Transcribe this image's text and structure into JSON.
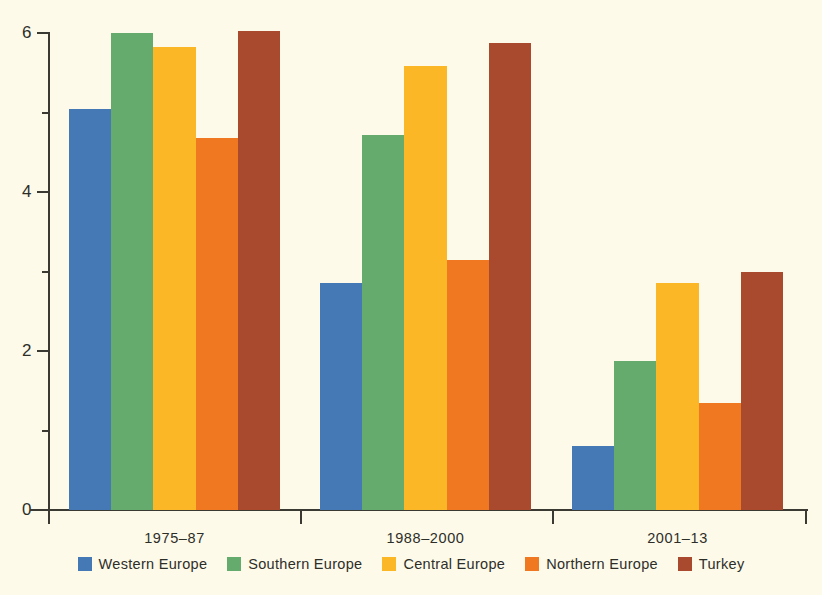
{
  "chart_data": {
    "type": "bar",
    "title": "",
    "subtitle": "",
    "xlabel": "",
    "ylabel": "",
    "categories": [
      "1975–87",
      "1988–2000",
      "2001–13"
    ],
    "series": [
      {
        "name": "Western Europe",
        "color": "#4479b5",
        "values": [
          5.05,
          2.85,
          0.8
        ]
      },
      {
        "name": "Southern Europe",
        "color": "#66ab6e",
        "values": [
          6.0,
          4.72,
          1.87
        ]
      },
      {
        "name": "Central Europe",
        "color": "#fcb726",
        "values": [
          5.82,
          5.58,
          2.85
        ]
      },
      {
        "name": "Northern Europe",
        "color": "#f07820",
        "values": [
          4.68,
          3.15,
          1.35
        ]
      },
      {
        "name": "Turkey",
        "color": "#a94a2e",
        "values": [
          6.02,
          5.88,
          3.0
        ]
      }
    ],
    "ylim": [
      0,
      6
    ],
    "y_ticks": [
      0,
      2,
      4,
      6
    ],
    "y_tick_labels": [
      "0",
      "2",
      "4",
      "6"
    ],
    "y_minor_ticks": [
      1,
      3,
      5
    ],
    "grid": false,
    "legend_position": "bottom"
  },
  "axes": {
    "y_label_0": "0",
    "y_label_2": "2",
    "y_label_4": "4",
    "y_label_6": "6"
  },
  "legend": {
    "items": [
      {
        "label": "Western Europe"
      },
      {
        "label": "Southern Europe"
      },
      {
        "label": "Central Europe"
      },
      {
        "label": "Northern Europe"
      },
      {
        "label": "Turkey"
      }
    ]
  },
  "colors": {
    "background": "#fdfaea",
    "axis": "#3a3a32",
    "text": "#2e2e28",
    "western_europe": "#4479b5",
    "southern_europe": "#66ab6e",
    "central_europe": "#fcb726",
    "northern_europe": "#f07820",
    "turkey": "#a94a2e"
  }
}
